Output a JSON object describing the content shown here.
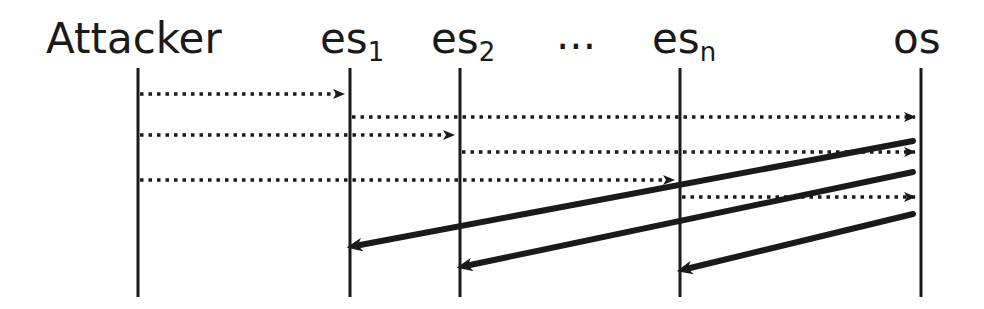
{
  "diagram": {
    "type": "sequence-diagram",
    "participants": [
      {
        "id": "attacker",
        "label": "Attacker",
        "sub": "",
        "x": 138
      },
      {
        "id": "es1",
        "label": "es",
        "sub": "1",
        "x": 350
      },
      {
        "id": "es2",
        "label": "es",
        "sub": "2",
        "x": 460
      },
      {
        "id": "esn",
        "label": "es",
        "sub": "n",
        "x": 680
      },
      {
        "id": "os",
        "label": "os",
        "sub": "",
        "x": 921
      }
    ],
    "ellipsis": "...",
    "messages": [
      {
        "from": "attacker",
        "to": "es1",
        "style": "dotted",
        "y1": 94,
        "y2": 94
      },
      {
        "from": "es1",
        "to": "os",
        "style": "dotted",
        "y1": 117,
        "y2": 117
      },
      {
        "from": "attacker",
        "to": "es2",
        "style": "dotted",
        "y1": 135,
        "y2": 135
      },
      {
        "from": "es2",
        "to": "os",
        "style": "dotted",
        "y1": 152,
        "y2": 152
      },
      {
        "from": "attacker",
        "to": "esn",
        "style": "dotted",
        "y1": 180,
        "y2": 180
      },
      {
        "from": "esn",
        "to": "os",
        "style": "dotted",
        "y1": 197,
        "y2": 197
      },
      {
        "from": "os",
        "to": "es1",
        "style": "solid",
        "y1": 141,
        "y2": 245
      },
      {
        "from": "os",
        "to": "es2",
        "style": "solid",
        "y1": 172,
        "y2": 265
      },
      {
        "from": "os",
        "to": "esn",
        "style": "solid",
        "y1": 214,
        "y2": 268
      }
    ]
  }
}
